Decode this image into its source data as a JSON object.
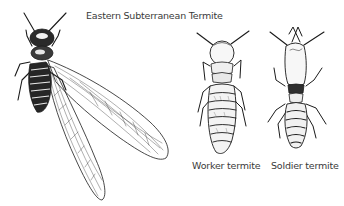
{
  "figure": {
    "title": "Eastern Subterranean Termite",
    "style": "black-and-white pen illustration",
    "colors": {
      "ink": "#1a1a1a",
      "background": "#ffffff",
      "text": "#3a3a3a"
    },
    "specimens": [
      {
        "id": "winged",
        "label": "",
        "description": "Winged reproductive (swarmer) with two long translucent veined wings"
      },
      {
        "id": "worker",
        "label": "Worker termite"
      },
      {
        "id": "soldier",
        "label": "Soldier termite"
      }
    ]
  }
}
